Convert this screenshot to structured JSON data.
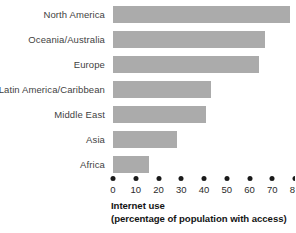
{
  "chart_data": {
    "type": "bar",
    "orientation": "horizontal",
    "title": "",
    "xlabel": "Internet use (percentage of population with access)",
    "ylabel": "",
    "categories": [
      "North America",
      "Oceania/Australia",
      "Europe",
      "Latin America/Caribbean",
      "Middle East",
      "Asia",
      "Africa"
    ],
    "values": [
      78,
      67,
      64,
      43,
      41,
      28,
      16
    ],
    "xlim": [
      0,
      80
    ],
    "xticks": [
      0,
      10,
      20,
      30,
      40,
      50,
      60,
      70,
      80
    ],
    "xtick_labels": [
      "0",
      "10",
      "20",
      "30",
      "40",
      "50",
      "60",
      "70",
      "80"
    ],
    "grid": false,
    "legend": false,
    "bar_color": "#ababab",
    "background_color": "#ffffff",
    "tick_marker_style": "dot"
  },
  "axis_title": {
    "line1": "Internet use",
    "line2": "(percentage of population with access)"
  }
}
